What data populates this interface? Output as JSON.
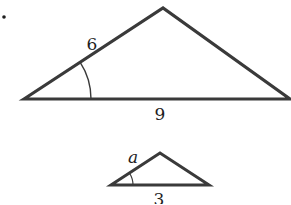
{
  "problem": {
    "number_suffix": "."
  },
  "figures": [
    {
      "id": "large-triangle",
      "vertices": {
        "left": [
          24,
          99
        ],
        "apex": [
          163,
          8
        ],
        "right": [
          290,
          99
        ]
      },
      "labels": {
        "left_side": "6",
        "base": "9"
      },
      "angle_marker": "arc at left vertex"
    },
    {
      "id": "small-triangle",
      "vertices": {
        "left": [
          111,
          185
        ],
        "apex": [
          160,
          153
        ],
        "right": [
          209,
          185
        ]
      },
      "labels": {
        "left_side": "a",
        "base": "3"
      },
      "angle_marker": "arc at left vertex"
    }
  ],
  "colors": {
    "stroke": "#3a3a3a",
    "text": "#1e1e1e",
    "background": "#ffffff"
  }
}
